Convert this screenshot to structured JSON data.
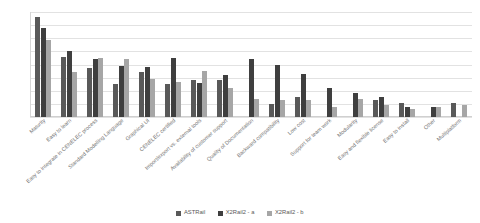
{
  "chart_data": {
    "type": "bar",
    "title": "",
    "xlabel": "",
    "ylabel": "",
    "ylim": [
      0,
      80
    ],
    "yticks": [
      80,
      70,
      60,
      50,
      40,
      30,
      20,
      10,
      0
    ],
    "grid": true,
    "legend_position": "bottom",
    "categories": [
      "Maturity",
      "Easy to learn",
      "Easy to integrate in CENELEC process",
      "Standard Modelling Language",
      "Graphical UI",
      "CENELEC certified",
      "Import/export vs. external tools",
      "Availability of customer support",
      "Quality of Documentation",
      "Backward compatibility",
      "Low cost",
      "Support for team work",
      "Modularity",
      "Easy and flexible license",
      "Easy to install",
      "Other",
      "Multiplatform"
    ],
    "series": [
      {
        "name": "ASTRail",
        "color": "#595959",
        "values": [
          76,
          46,
          37,
          25,
          34,
          25,
          28,
          28,
          0,
          10,
          15,
          0,
          0,
          13,
          11,
          0,
          11
        ]
      },
      {
        "name": "X2Rail2 - a",
        "color": "#3f3f3f",
        "values": [
          68,
          50,
          44,
          39,
          38,
          45,
          26,
          32,
          44,
          40,
          33,
          22,
          18,
          15,
          8,
          8,
          0
        ]
      },
      {
        "name": "X2Rail2 - b",
        "color": "#a6a6a6",
        "values": [
          59,
          34,
          45,
          44,
          29,
          27,
          35,
          22,
          14,
          13,
          13,
          8,
          14,
          9,
          6,
          8,
          9
        ]
      }
    ],
    "extra_series_points": {
      "note": "",
      "group9_third": 24,
      "group12_third": 23,
      "group13_third": 14
    }
  },
  "legend": {
    "items": [
      {
        "label": "ASTRail",
        "color": "#595959"
      },
      {
        "label": "X2Rail2 - a",
        "color": "#3f3f3f"
      },
      {
        "label": "X2Rail2 - b",
        "color": "#a6a6a6"
      }
    ]
  }
}
